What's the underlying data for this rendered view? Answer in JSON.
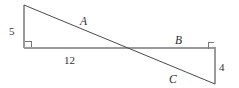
{
  "figure": {
    "type": "geometry-diagram",
    "background_color": "#ffffff",
    "line_color_primary": "#9a9a9a",
    "line_color_diagonal": "#4a4a4a",
    "text_color": "#2b2b2b",
    "segments": [
      {
        "name": "left-vertical-leg",
        "label": "5",
        "x1": 24,
        "y1": 5,
        "x2": 24,
        "y2": 48,
        "color": "#9a9a9a"
      },
      {
        "name": "horizontal-base",
        "label": "12",
        "x1": 24,
        "y1": 48,
        "x2": 216,
        "y2": 48,
        "color": "#9a9a9a"
      },
      {
        "name": "right-vertical-leg",
        "label": "4",
        "x1": 215,
        "y1": 48,
        "x2": 215,
        "y2": 84,
        "color": "#9a9a9a"
      },
      {
        "name": "transversal-hypotenuse",
        "label": "",
        "x1": 24,
        "y1": 5,
        "x2": 215,
        "y2": 84,
        "color": "#4a4a4a"
      }
    ],
    "right_angle_markers": [
      {
        "name": "left-right-angle",
        "x": 25,
        "y": 41,
        "size": 6
      },
      {
        "name": "right-right-angle",
        "x": 208,
        "y": 42,
        "size": 6
      }
    ],
    "labels": [
      {
        "id": "label-5",
        "name": "side-length-5",
        "text": "5",
        "style": "numeric"
      },
      {
        "id": "label-12",
        "name": "side-length-12",
        "text": "12",
        "style": "numeric"
      },
      {
        "id": "label-4",
        "name": "side-length-4",
        "text": "4",
        "style": "numeric"
      },
      {
        "id": "label-A",
        "name": "segment-label-a",
        "text": "A",
        "style": "alpha"
      },
      {
        "id": "label-B",
        "name": "segment-label-b",
        "text": "B",
        "style": "alpha"
      },
      {
        "id": "label-C",
        "name": "segment-label-c",
        "text": "C",
        "style": "alpha"
      }
    ]
  }
}
